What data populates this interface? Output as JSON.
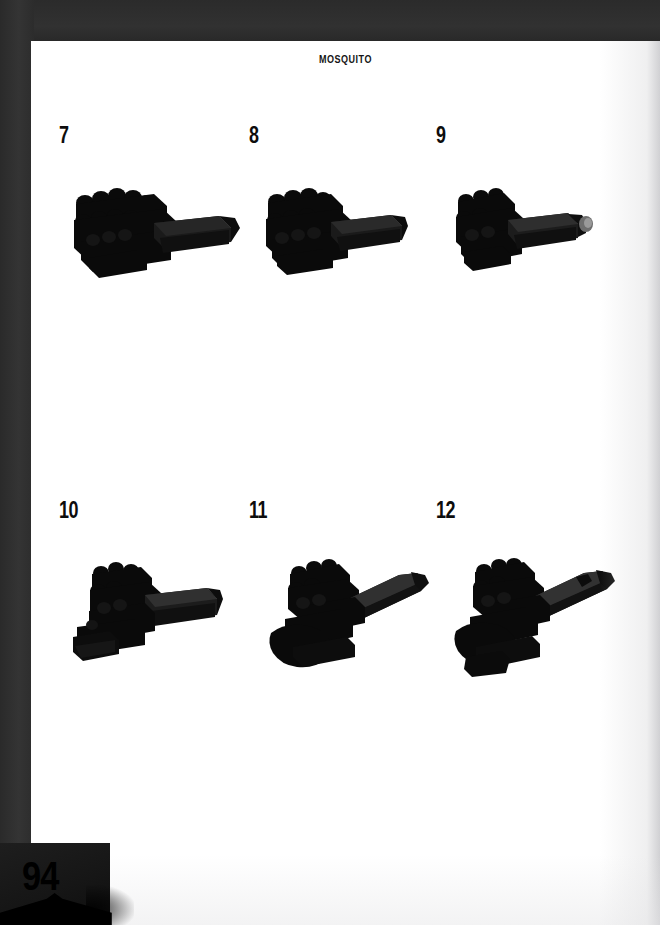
{
  "document": {
    "title": "MOSQUITO",
    "page_number": "94",
    "background_color": "#2e2e2e",
    "page_color": "#ffffff",
    "ink_color": "#0d0d0d"
  },
  "steps": [
    {
      "number": "7",
      "model_name": "lego-assembly-step-7",
      "description": "Black L-shaped brick assembly with stud cluster at left and elongated arm to the right"
    },
    {
      "number": "8",
      "model_name": "lego-assembly-step-8",
      "description": "Black L-shaped assembly, compact, arm extending right"
    },
    {
      "number": "9",
      "model_name": "lego-assembly-step-9",
      "description": "Black assembly with small light-gray pin at the right tip"
    },
    {
      "number": "10",
      "model_name": "lego-assembly-step-10",
      "description": "Black assembly grown downward-left with added lower bricks"
    },
    {
      "number": "11",
      "model_name": "lego-assembly-step-11",
      "description": "Black fuselage with long tapered wing angling up to the right"
    },
    {
      "number": "12",
      "model_name": "lego-assembly-step-12",
      "description": "Black fuselage with tapered wing and additional nose detail"
    }
  ]
}
